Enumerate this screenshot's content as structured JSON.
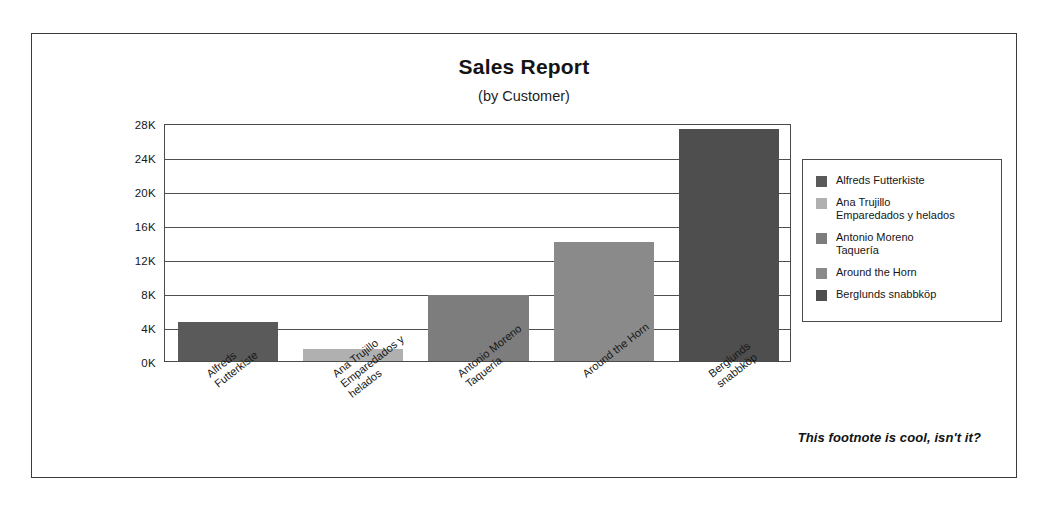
{
  "chart_data": {
    "type": "bar",
    "title": "Sales Report",
    "subtitle": "(by Customer)",
    "xlabel": "",
    "ylabel": "",
    "categories": [
      "Alfreds\nFutterkiste",
      "Ana Trujillo\nEmparedados y\nhelados",
      "Antonio Moreno\nTaquería",
      "Around the Horn",
      "Berglunds\nsnabbköp"
    ],
    "values": [
      4600,
      1400,
      7800,
      14000,
      27300
    ],
    "bar_colors": [
      "#5a5a5a",
      "#b0b0b0",
      "#7d7d7d",
      "#8a8a8a",
      "#4e4e4e"
    ],
    "ylim": [
      0,
      28000
    ],
    "ytick_values": [
      0,
      4000,
      8000,
      12000,
      16000,
      20000,
      24000,
      28000
    ],
    "ytick_labels": [
      "0K",
      "4K",
      "8K",
      "12K",
      "16K",
      "20K",
      "24K",
      "28K"
    ],
    "grid": true,
    "legend_position": "right",
    "legend": [
      {
        "label": "Alfreds Futterkiste",
        "color": "#5a5a5a"
      },
      {
        "label": "Ana Trujillo\nEmparedados y helados",
        "color": "#b0b0b0"
      },
      {
        "label": "Antonio Moreno\nTaquería",
        "color": "#7d7d7d"
      },
      {
        "label": "Around the Horn",
        "color": "#8a8a8a"
      },
      {
        "label": "Berglunds snabbköp",
        "color": "#4e4e4e"
      }
    ],
    "footnote": "This footnote is cool, isn't it?"
  },
  "frame": {
    "border_color": "#3b3b3b"
  }
}
